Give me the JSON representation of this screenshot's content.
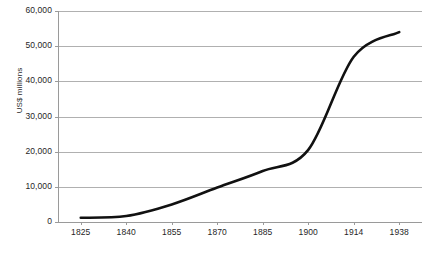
{
  "chart_data": {
    "type": "line",
    "title": "",
    "subtitle": "",
    "xlabel": "",
    "ylabel": "US$ millions",
    "xlim": [
      1825,
      1938
    ],
    "ylim": [
      0,
      60000
    ],
    "grid": true,
    "legend": false,
    "legend_position": "none",
    "x_tick_labels": [
      "1825",
      "1840",
      "1855",
      "1870",
      "1885",
      "1900",
      "1914",
      "1938"
    ],
    "y_tick_labels": [
      "0",
      "10,000",
      "20,000",
      "30,000",
      "40,000",
      "50,000",
      "60,000"
    ],
    "y_tick_values": [
      0,
      10000,
      20000,
      30000,
      40000,
      50000,
      60000
    ],
    "series": [
      {
        "name": "World trade value",
        "color": "#111111",
        "x": [
          1825,
          1840,
          1855,
          1870,
          1885,
          1900,
          1914,
          1938
        ],
        "values": [
          1200,
          1700,
          5000,
          9800,
          14500,
          20500,
          47000,
          54000
        ]
      }
    ],
    "annotations": []
  },
  "axes": {
    "y_title": "US$ millions",
    "y_ticks": [
      {
        "label": "60,000",
        "value": 60000
      },
      {
        "label": "50,000",
        "value": 50000
      },
      {
        "label": "40,000",
        "value": 40000
      },
      {
        "label": "30,000",
        "value": 30000
      },
      {
        "label": "20,000",
        "value": 20000
      },
      {
        "label": "10,000",
        "value": 10000
      },
      {
        "label": "0",
        "value": 0
      }
    ],
    "x_ticks": [
      {
        "label": "1825"
      },
      {
        "label": "1840"
      },
      {
        "label": "1855"
      },
      {
        "label": "1870"
      },
      {
        "label": "1885"
      },
      {
        "label": "1900"
      },
      {
        "label": "1914"
      },
      {
        "label": "1938"
      }
    ]
  },
  "style": {
    "background": "#ffffff",
    "grid_color": "#b0b0b0",
    "axis_color": "#9a9a9a",
    "line_color": "#111111",
    "text_color": "#1f1f1f"
  },
  "caption": {
    "text": ""
  }
}
